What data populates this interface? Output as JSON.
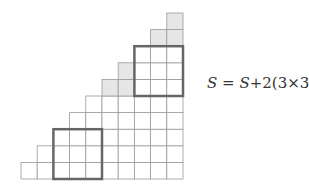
{
  "diagram": {
    "columns": 10,
    "origin": {
      "x": 21,
      "y": 179
    },
    "cell_w": 16.2,
    "cell_h": 16.6,
    "staircase_heights": [
      1,
      2,
      3,
      4,
      5,
      6,
      7,
      8,
      9,
      10
    ],
    "shaded_cells": [
      [
        5,
        5
      ],
      [
        6,
        5
      ],
      [
        6,
        6
      ],
      [
        8,
        8
      ],
      [
        9,
        8
      ],
      [
        9,
        9
      ]
    ],
    "highlight_boxes": [
      {
        "col": 2,
        "row": 0,
        "size": 3
      },
      {
        "col": 7,
        "row": 5,
        "size": 3
      }
    ],
    "colors": {
      "grid": "#9a9a9a",
      "shade": "#e6e6e6",
      "box": "#666666"
    }
  },
  "formula": {
    "lhs": "S",
    "equals": " = ",
    "rhs_var": "S",
    "rhs_rest": "+2(3×3)"
  }
}
